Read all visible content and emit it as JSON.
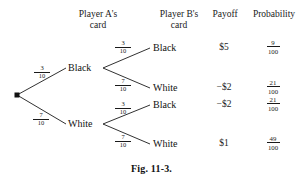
{
  "figure": {
    "caption": "Fig. 11-3.",
    "headers": [
      {
        "id": "player-a",
        "line1": "Player A's",
        "line2": "card"
      },
      {
        "id": "player-b",
        "line1": "Player B's",
        "line2": "card"
      },
      {
        "id": "payoff",
        "line1": "Payoff",
        "line2": ""
      },
      {
        "id": "probability",
        "line1": "Probability",
        "line2": ""
      }
    ],
    "root": {
      "marker": "filled-dot"
    },
    "level1": [
      {
        "id": "a-black",
        "label": "Black",
        "prob_num": "3",
        "prob_den": "10"
      },
      {
        "id": "a-white",
        "label": "White",
        "prob_num": "7",
        "prob_den": "10"
      }
    ],
    "outcomes": [
      {
        "id": "black-black",
        "parent": "Black",
        "player_b_card": "Black",
        "branch_num": "3",
        "branch_den": "10",
        "payoff": "$5",
        "prob_num": "9",
        "prob_den": "100"
      },
      {
        "id": "black-white",
        "parent": "Black",
        "player_b_card": "White",
        "branch_num": "7",
        "branch_den": "10",
        "payoff": "−$2",
        "prob_num": "21",
        "prob_den": "100"
      },
      {
        "id": "white-black",
        "parent": "White",
        "player_b_card": "Black",
        "branch_num": "3",
        "branch_den": "10",
        "payoff": "−$2",
        "prob_num": "21",
        "prob_den": "100"
      },
      {
        "id": "white-white",
        "parent": "White",
        "player_b_card": "White",
        "branch_num": "7",
        "branch_den": "10",
        "payoff": "$1",
        "prob_num": "49",
        "prob_den": "100"
      }
    ],
    "colors": {
      "line": "#1a1a1a",
      "text": "#1a1a1a",
      "background": "#ffffff"
    }
  }
}
